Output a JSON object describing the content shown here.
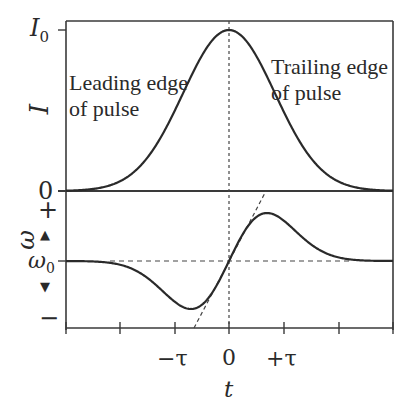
{
  "chart_data": {
    "type": "line",
    "title": "",
    "xlabel": "t",
    "x_ticks": [
      "-τ",
      "0",
      "+τ"
    ],
    "panels": [
      {
        "name": "intensity",
        "ylabel": "I",
        "y_ticks": [
          "0",
          "I0"
        ],
        "series": [
          {
            "name": "I(t) Gaussian pulse",
            "shape": "gaussian",
            "peak_x": 0,
            "peak_y": "I0"
          }
        ],
        "annotations": [
          "Leading edge of pulse",
          "Trailing edge of pulse"
        ],
        "reference_lines": [
          "vertical dotted at t=0"
        ]
      },
      {
        "name": "frequency",
        "ylabel": "ω",
        "y_ticks": [
          "−",
          "ω0",
          "+"
        ],
        "series": [
          {
            "name": "ω(t) chirp",
            "shape": "derivative-of-gaussian",
            "min_x": "≈ -0.7τ",
            "max_x": "≈ +0.7τ",
            "center": "ω0 at t=0"
          }
        ],
        "reference_lines": [
          "horizontal dashed at ω0",
          "vertical dotted at t=0",
          "dashed linear tangent through (0, ω0)"
        ]
      }
    ]
  },
  "labels": {
    "i0": "I",
    "i0_sub": "0",
    "i_axis": "I",
    "zero_top": "0",
    "leading_line1": "Leading edge",
    "leading_line2": "of pulse",
    "trailing_line1": "Trailing edge",
    "trailing_line2": "of pulse",
    "plus": "+",
    "minus": "−",
    "omega_axis": "ω",
    "omega0": "ω",
    "omega0_sub": "0",
    "arrow_up": "▲",
    "arrow_down": "▼",
    "tick_minus_tau": "−τ",
    "tick_zero": "0",
    "tick_plus_tau": "+τ",
    "x_axis": "t"
  },
  "colors": {
    "line": "#2a2a2a",
    "background": "#ffffff"
  }
}
